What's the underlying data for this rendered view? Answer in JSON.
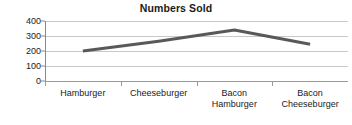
{
  "chart_data": {
    "type": "line",
    "title": "Numbers Sold",
    "xlabel": "",
    "ylabel": "",
    "categories": [
      "Hamburger",
      "Cheeseburger",
      "Bacon Hamburger",
      "Bacon Cheeseburger"
    ],
    "category_lines": [
      [
        "Hamburger"
      ],
      [
        "Cheeseburger"
      ],
      [
        "Bacon",
        "Hamburger"
      ],
      [
        "Bacon",
        "Cheeseburger"
      ]
    ],
    "values": [
      200,
      265,
      340,
      245
    ],
    "series": [
      {
        "name": "Numbers Sold",
        "values": [
          200,
          265,
          340,
          245
        ]
      }
    ],
    "ylim": [
      0,
      400
    ],
    "ytick_labels": [
      "400",
      "300",
      "200",
      "100",
      "0"
    ],
    "ytick_values": [
      400,
      300,
      200,
      100,
      0
    ],
    "grid": true,
    "grid_axis": "y",
    "legend": false,
    "legend_position": "none",
    "markers": false,
    "colors": {
      "line": "#595959",
      "gridline": "#c8c8c8",
      "axis": "#8a8a8a",
      "text": "#1a1a1a",
      "background": "#ffffff"
    }
  }
}
